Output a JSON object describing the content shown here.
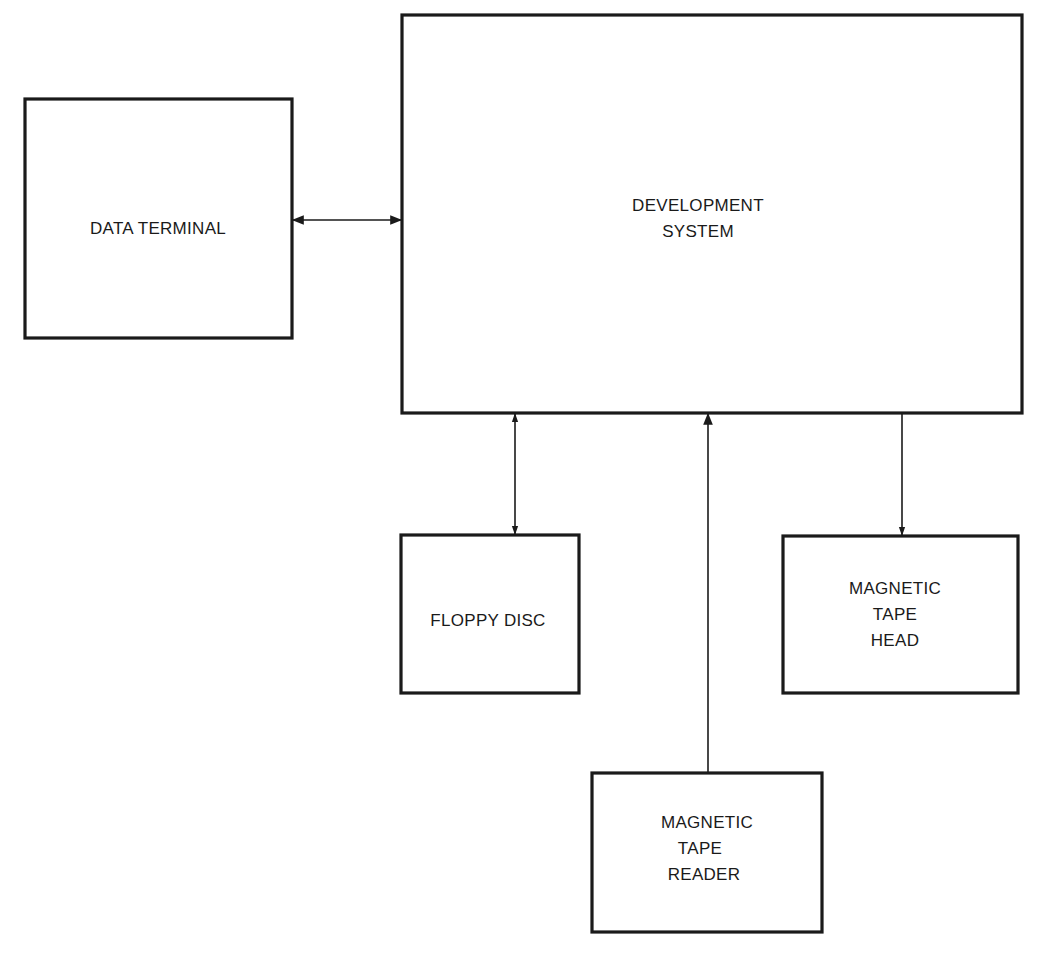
{
  "diagram": {
    "type": "block-diagram",
    "colors": {
      "stroke": "#1a1a1a",
      "background": "#ffffff",
      "text": "#1a1a1a"
    },
    "nodes": [
      {
        "id": "data-terminal",
        "lines": [
          "DATA TERMINAL"
        ],
        "x": 25,
        "y": 98,
        "w": 267,
        "h": 240
      },
      {
        "id": "development-system",
        "lines": [
          "DEVELOPMENT",
          "SYSTEM"
        ],
        "x": 402,
        "y": 14,
        "w": 620,
        "h": 399
      },
      {
        "id": "floppy-disc",
        "lines": [
          "FLOPPY DISC"
        ],
        "x": 400,
        "y": 534,
        "w": 179,
        "h": 159
      },
      {
        "id": "magnetic-tape-head",
        "lines": [
          "MAGNETIC",
          "TAPE",
          "HEAD"
        ],
        "x": 782,
        "y": 535,
        "w": 236,
        "h": 158
      },
      {
        "id": "magnetic-tape-reader",
        "lines": [
          "MAGNETIC",
          "TAPE",
          "READER"
        ],
        "x": 592,
        "y": 772,
        "w": 231,
        "h": 160
      }
    ],
    "edges": [
      {
        "from": "data-terminal",
        "to": "development-system",
        "direction": "bidirectional"
      },
      {
        "from": "development-system",
        "to": "floppy-disc",
        "direction": "bidirectional"
      },
      {
        "from": "magnetic-tape-reader",
        "to": "development-system",
        "direction": "one-way"
      },
      {
        "from": "development-system",
        "to": "magnetic-tape-head",
        "direction": "one-way"
      }
    ]
  },
  "labels": {
    "data_terminal": "DATA TERMINAL",
    "development_system_1": "DEVELOPMENT",
    "development_system_2": "SYSTEM",
    "floppy_disc": "FLOPPY DISC",
    "tape_head_1": "MAGNETIC",
    "tape_head_2": "TAPE",
    "tape_head_3": "HEAD",
    "tape_reader_1": "MAGNETIC",
    "tape_reader_2": "TAPE",
    "tape_reader_3": "READER"
  }
}
